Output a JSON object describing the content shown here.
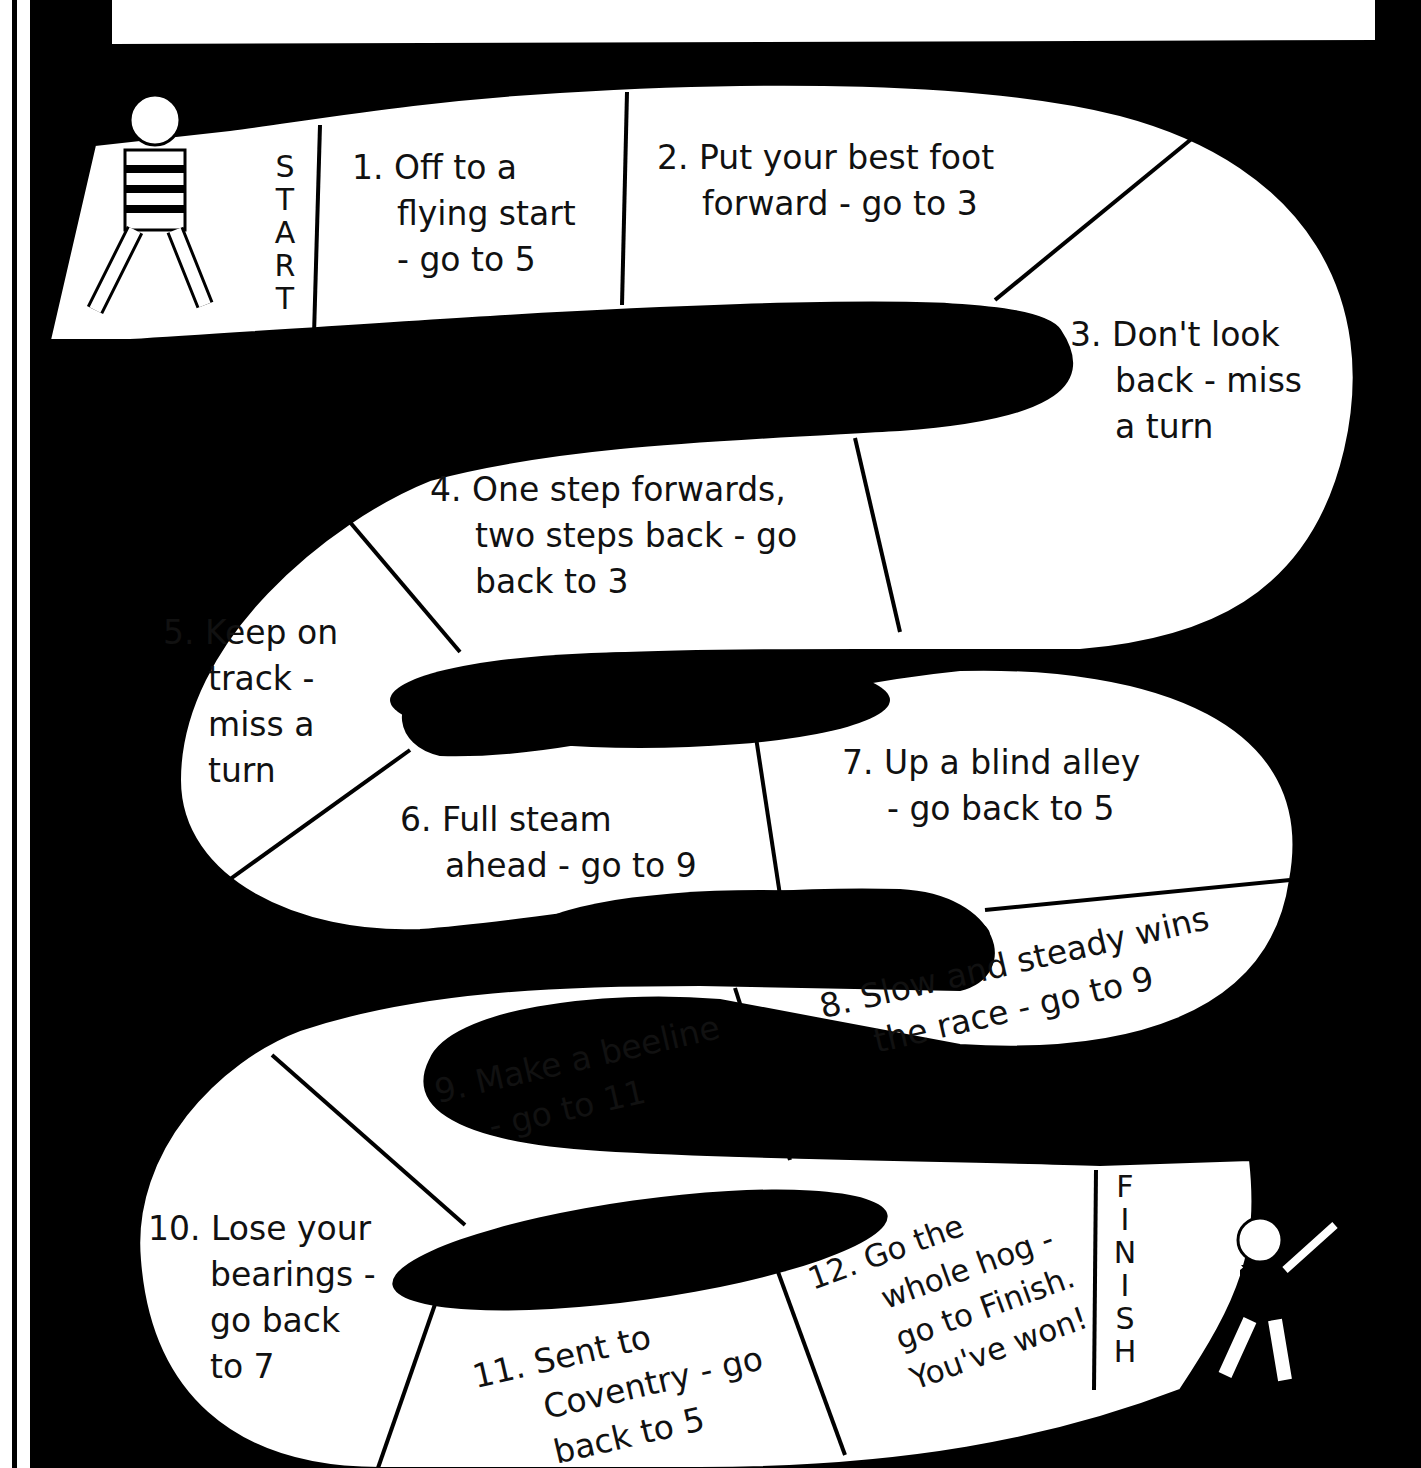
{
  "game": {
    "start_label": [
      "S",
      "T",
      "A",
      "R",
      "T"
    ],
    "finish_label": [
      "F",
      "I",
      "N",
      "I",
      "S",
      "H"
    ],
    "squares": [
      {
        "number": "1.",
        "lines": [
          "Off to a",
          "flying start",
          "- go to 5"
        ]
      },
      {
        "number": "2.",
        "lines": [
          "Put your best foot",
          "forward - go to 3"
        ]
      },
      {
        "number": "3.",
        "lines": [
          "Don't look",
          "back - miss",
          "a turn"
        ]
      },
      {
        "number": "4.",
        "lines": [
          "One step forwards,",
          "two steps back - go",
          "back to 3"
        ]
      },
      {
        "number": "5.",
        "lines": [
          "Keep on",
          "track -",
          "miss a",
          "turn"
        ]
      },
      {
        "number": "6.",
        "lines": [
          "Full steam",
          "ahead - go to 9"
        ]
      },
      {
        "number": "7.",
        "lines": [
          "Up a blind alley",
          "- go back to 5"
        ]
      },
      {
        "number": "8.",
        "lines": [
          "Slow and steady wins",
          "the race - go to 9"
        ]
      },
      {
        "number": "9.",
        "lines": [
          "Make a beeline",
          "- go to 11"
        ]
      },
      {
        "number": "10.",
        "lines": [
          "Lose your",
          "bearings -",
          "go back",
          "to 7"
        ]
      },
      {
        "number": "11.",
        "lines": [
          "Sent to",
          "Coventry - go",
          "back to 5"
        ]
      },
      {
        "number": "12.",
        "lines": [
          "Go the",
          "whole hog -",
          "go to Finish.",
          "You've won!"
        ]
      }
    ],
    "colors": {
      "background": "#000000",
      "path": "#ffffff",
      "text": "#111111"
    }
  }
}
